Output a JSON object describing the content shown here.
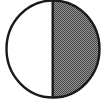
{
  "figure": {
    "name": "half-shaded-circle",
    "description": "A circle outlined in black, divided by a vertical diameter. The left semicircle is unshaded (white) and the right semicircle is shaded with a 50 percent checkerboard halftone pattern.",
    "canvas": {
      "width": 107,
      "height": 102,
      "background_color": "#ffffff"
    },
    "circle": {
      "center_x": 53,
      "center_y": 49,
      "radius_x": 46.5,
      "radius_y": 48.5,
      "outline_color": "#1a1a1a",
      "outline_width": 2.4
    },
    "divider": {
      "label": "vertical diameter",
      "x": 52.5,
      "y_top": 1,
      "y_bottom": 97,
      "color": "#1a1a1a",
      "width": 2.4
    },
    "halves": [
      {
        "label": "left half",
        "side": "left",
        "fill": "none",
        "fill_color": "#ffffff",
        "fraction": "1/2"
      },
      {
        "label": "right half",
        "side": "right",
        "fill": "checkerboard-halftone",
        "fill_color": "#6e6e6e",
        "pattern_dark": "#4a4a4a",
        "pattern_light": "#8f8f8f",
        "fraction": "1/2"
      }
    ]
  }
}
